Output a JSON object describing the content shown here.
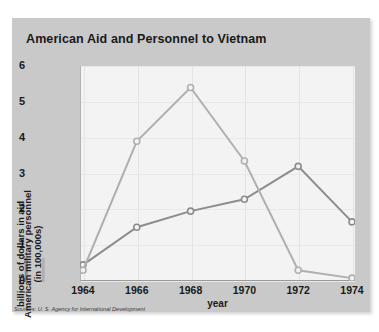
{
  "card": {
    "title": "American Aid and Personnel to Vietnam",
    "source_note": "Sources: U. S. Agency for International Development",
    "background_color": "#c9c9c9",
    "plot_background_color": "#f3f3f3"
  },
  "chart_data": {
    "type": "line",
    "title": "American Aid and Personnel to Vietnam",
    "xlabel": "year",
    "ylabel": "",
    "categories": [
      "1964",
      "1966",
      "1968",
      "1970",
      "1972",
      "1974"
    ],
    "x": [
      1964,
      1966,
      1968,
      1970,
      1972,
      1974
    ],
    "ylim": [
      0,
      6
    ],
    "xlim": [
      1964,
      1974
    ],
    "yticks": [
      "0",
      "1",
      "2",
      "3",
      "4",
      "5",
      "6"
    ],
    "ytick_values": [
      0,
      1,
      2,
      3,
      4,
      5,
      6
    ],
    "grid": true,
    "legend_position": "left-rotated",
    "marker": "circle",
    "series": [
      {
        "name": "billions of dollars in aid",
        "color": "#8c8c8c",
        "values": [
          0.45,
          1.5,
          1.95,
          2.28,
          3.2,
          1.65
        ]
      },
      {
        "name": "American military personnel (in 100,000s)",
        "color": "#b0b0b0",
        "values": [
          0.3,
          3.9,
          5.4,
          3.35,
          0.3,
          0.08
        ]
      }
    ]
  },
  "legend": {
    "entries": [
      {
        "label": "billions of dollars in aid",
        "color": "#8c8c8c"
      },
      {
        "label": "American military personnel\n(in 100,000s)",
        "color": "#b0b0b0"
      }
    ],
    "line1_label": "billions of dollars in aid",
    "line2_label_top": "American military personnel",
    "line2_label_bottom": "(in 100,000s)"
  },
  "axis": {
    "x_label": "year",
    "x_ticks": [
      "1964",
      "1966",
      "1968",
      "1970",
      "1972",
      "1974"
    ],
    "y_ticks": [
      "6",
      "5",
      "4",
      "3",
      "2",
      "1",
      "0"
    ]
  }
}
